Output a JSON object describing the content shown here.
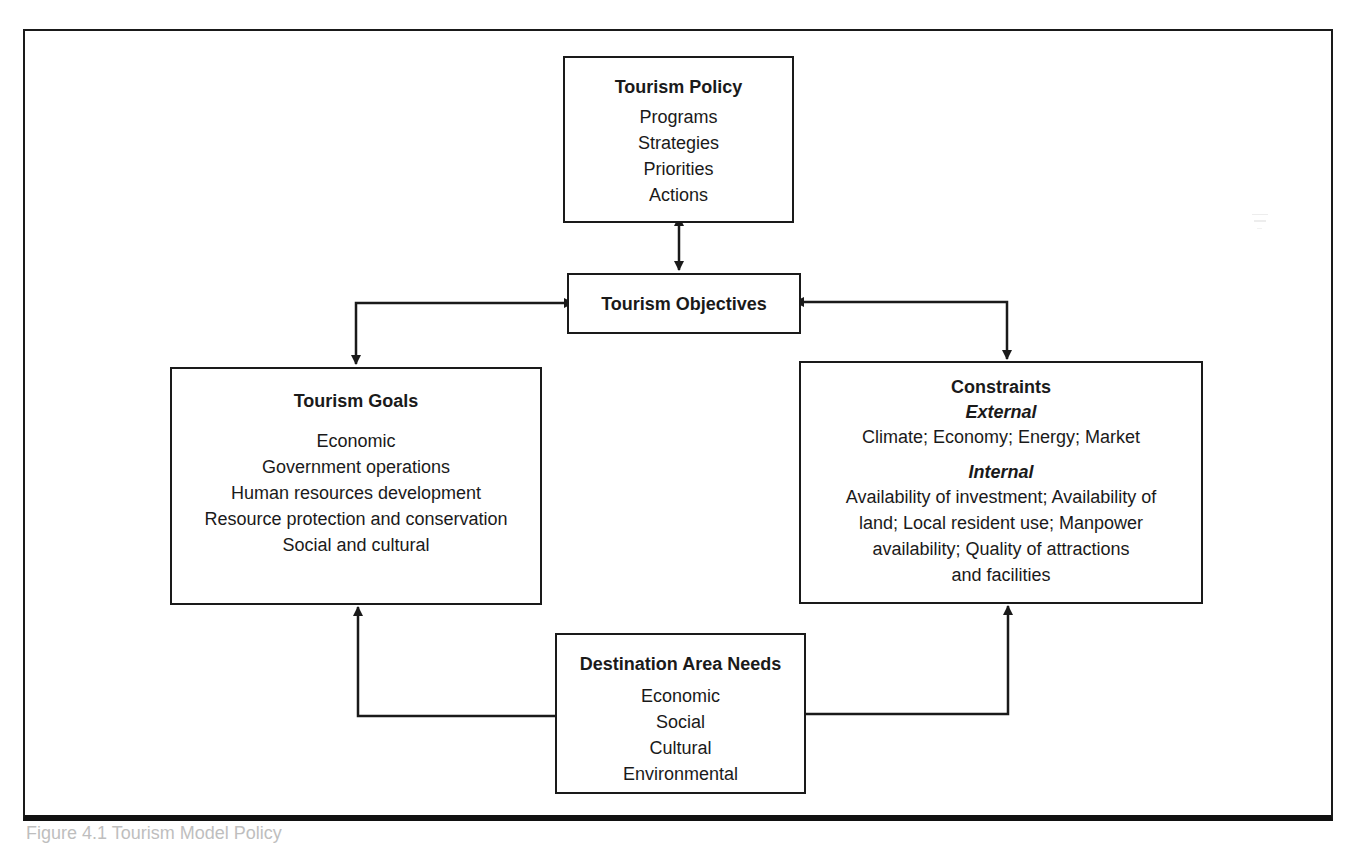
{
  "diagram": {
    "type": "flow-diagram",
    "nodes": {
      "policy": {
        "title": "Tourism Policy",
        "items": [
          "Programs",
          "Strategies",
          "Priorities",
          "Actions"
        ]
      },
      "objectives": {
        "title": "Tourism Objectives"
      },
      "goals": {
        "title": "Tourism Goals",
        "items": [
          "Economic",
          "Government operations",
          "Human resources development",
          "Resource protection and conservation",
          "Social and cultural"
        ]
      },
      "constraints": {
        "title": "Constraints",
        "external_label": "External",
        "external_text": "Climate; Economy; Energy; Market",
        "internal_label": "Internal",
        "internal_lines": [
          "Availability of investment; Availability of",
          "land; Local resident use; Manpower",
          "availability; Quality of attractions",
          "and facilities"
        ]
      },
      "needs": {
        "title": "Destination Area Needs",
        "items": [
          "Economic",
          "Social",
          "Cultural",
          "Environmental"
        ]
      }
    },
    "edges": [
      {
        "from": "Tourism Policy",
        "to": "Tourism Objectives",
        "direction": "bidirectional"
      },
      {
        "from": "Tourism Objectives",
        "to": "Tourism Goals",
        "direction": "bidirectional"
      },
      {
        "from": "Tourism Objectives",
        "to": "Constraints",
        "direction": "bidirectional"
      },
      {
        "from": "Destination Area Needs",
        "to": "Tourism Goals",
        "direction": "forward"
      },
      {
        "from": "Destination Area Needs",
        "to": "Constraints",
        "direction": "forward"
      }
    ],
    "colors": {
      "line": "#1a1a1a",
      "background": "#ffffff"
    }
  },
  "caption": {
    "text": "Figure 4.1 Tourism Model Policy"
  }
}
